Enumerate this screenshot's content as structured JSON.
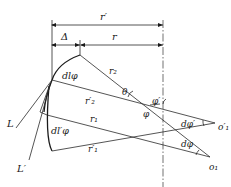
{
  "diagram": {
    "type": "geometric construction",
    "dimensions": {
      "r_prime": "r′",
      "delta": "Δ",
      "r": "r"
    },
    "labels": {
      "dl_phi": "dlφ",
      "dl_prime_phi": "dl′φ",
      "r2": "r₂",
      "r2_prime": "r′₂",
      "r1": "r₁",
      "r1_prime": "r′₁",
      "theta": "θ",
      "phi_prime": "φ′",
      "phi": "φ",
      "d_phi_prime": "dφ′",
      "d_phi": "dφ",
      "o1_prime": "o′₁",
      "o1": "o₁",
      "L": "L",
      "L_prime": "L′"
    },
    "colors": {
      "line": "#2a2a2a",
      "background": "#ffffff"
    }
  }
}
